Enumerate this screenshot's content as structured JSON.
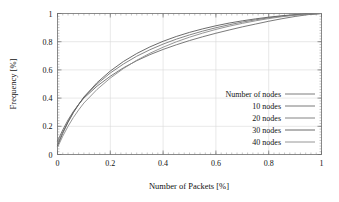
{
  "chart_data": {
    "type": "line",
    "title": "",
    "xlabel": "Number of Packets [%]",
    "ylabel": "Frequency [%]",
    "xlim": [
      0,
      1
    ],
    "ylim": [
      0,
      1
    ],
    "xticks": [
      "0",
      "0.2",
      "0.4",
      "0.6",
      "0.8",
      "1"
    ],
    "yticks": [
      "0",
      "0.2",
      "0.4",
      "0.6",
      "0.8",
      "1"
    ],
    "xtick_values": [
      0,
      0.2,
      0.4,
      0.6,
      0.8,
      1
    ],
    "ytick_values": [
      0,
      0.2,
      0.4,
      0.6,
      0.8,
      1
    ],
    "grid": true,
    "minor_ticks": true,
    "legend_title": "Number of nodes",
    "legend_position": "lower-right-inside",
    "x": [
      0,
      0.02,
      0.04,
      0.06,
      0.08,
      0.1,
      0.15,
      0.2,
      0.25,
      0.3,
      0.35,
      0.4,
      0.45,
      0.5,
      0.55,
      0.6,
      0.65,
      0.7,
      0.75,
      0.8,
      0.85,
      0.9,
      0.95,
      1
    ],
    "series": [
      {
        "name": "10 nodes",
        "color": "#6b6b6b",
        "values": [
          0.095,
          0.175,
          0.245,
          0.305,
          0.355,
          0.4,
          0.485,
          0.555,
          0.615,
          0.665,
          0.708,
          0.745,
          0.778,
          0.808,
          0.835,
          0.86,
          0.883,
          0.905,
          0.925,
          0.945,
          0.963,
          0.979,
          0.992,
          1.0
        ]
      },
      {
        "name": "20 nodes",
        "color": "#777777",
        "values": [
          0.075,
          0.16,
          0.235,
          0.3,
          0.355,
          0.405,
          0.5,
          0.578,
          0.642,
          0.697,
          0.743,
          0.783,
          0.818,
          0.848,
          0.875,
          0.899,
          0.92,
          0.939,
          0.955,
          0.969,
          0.981,
          0.99,
          0.996,
          1.0
        ]
      },
      {
        "name": "30 nodes",
        "color": "#5a5a5a",
        "values": [
          0.06,
          0.15,
          0.228,
          0.296,
          0.354,
          0.408,
          0.51,
          0.592,
          0.66,
          0.716,
          0.763,
          0.803,
          0.837,
          0.866,
          0.891,
          0.913,
          0.932,
          0.948,
          0.962,
          0.974,
          0.984,
          0.992,
          0.997,
          1.0
        ]
      },
      {
        "name": "40 nodes",
        "color": "#8a8a8a",
        "values": [
          0.05,
          0.13,
          0.2,
          0.262,
          0.316,
          0.365,
          0.462,
          0.542,
          0.61,
          0.668,
          0.718,
          0.761,
          0.799,
          0.832,
          0.861,
          0.887,
          0.91,
          0.93,
          0.948,
          0.964,
          0.977,
          0.988,
          0.996,
          1.0
        ]
      }
    ]
  },
  "legend": {
    "title": "Number of nodes",
    "entries": [
      {
        "label": "10 nodes"
      },
      {
        "label": "20 nodes"
      },
      {
        "label": "30 nodes"
      },
      {
        "label": "40 nodes"
      }
    ]
  },
  "axes": {
    "x_title": "Number of Packets [%]",
    "y_title": "Frequency [%]",
    "x_tick_labels": [
      "0",
      "0.2",
      "0.4",
      "0.6",
      "0.8",
      "1"
    ],
    "y_tick_labels": [
      "0",
      "0.2",
      "0.4",
      "0.6",
      "0.8",
      "1"
    ]
  }
}
